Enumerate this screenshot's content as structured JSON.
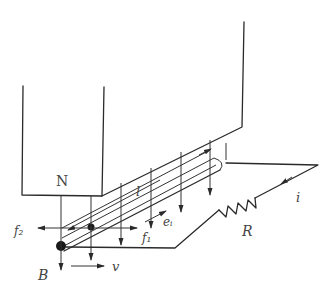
{
  "diagram": {
    "labels": {
      "pole": "N",
      "length": "l",
      "force_left": "f₂",
      "force_right": "f₁",
      "emf": "eᵢ",
      "resistor": "R",
      "current": "i",
      "field": "B",
      "velocity": "v"
    },
    "colors": {
      "ink": "#2a2a2a",
      "text": "#444444",
      "background": "#ffffff"
    }
  }
}
